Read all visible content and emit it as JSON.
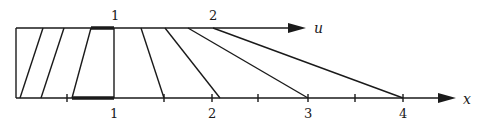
{
  "diagram": {
    "type": "characteristics-diagram",
    "axes": {
      "u_axis_label": "u",
      "x_axis_label": "x"
    },
    "top_labels": [
      "1",
      "2"
    ],
    "bottom_labels": [
      "1",
      "2",
      "3",
      "4"
    ],
    "colors": {
      "stroke": "#1a1a1a",
      "background": "#ffffff"
    }
  }
}
